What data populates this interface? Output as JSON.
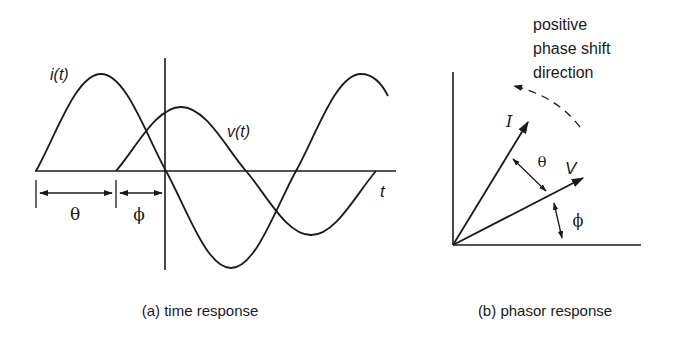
{
  "panels": {
    "time_response": {
      "caption": "(a) time response",
      "labels": {
        "current": "i(t)",
        "voltage": "v(t)",
        "time_axis": "t",
        "theta": "θ",
        "phi": "ϕ"
      }
    },
    "phasor_response": {
      "caption": "(b) phasor response",
      "labels": {
        "current_phasor": "I",
        "voltage_phasor": "V",
        "theta": "θ",
        "phi": "ϕ"
      },
      "annotation": {
        "line1": "positive",
        "line2": "phase shift",
        "line3": "direction"
      }
    }
  },
  "colors": {
    "ink": "#1a1a1a",
    "background": "#ffffff"
  }
}
